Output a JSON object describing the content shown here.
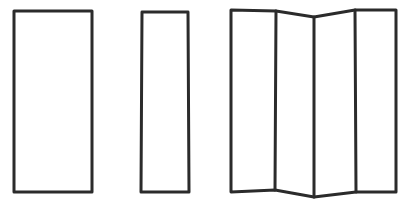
{
  "figure": {
    "background_color": "#ffffff",
    "stroke_color": "#2b2b2b",
    "stroke_width": 3,
    "canvas": {
      "width": 410,
      "height": 202
    }
  },
  "shapes": [
    {
      "id": "wide-rectangle",
      "label": "Wide rectangle",
      "kind": "rectangle",
      "points": "14,11 92,11 92,192 14,192",
      "bounds": {
        "x": 14,
        "y": 11,
        "width": 78,
        "height": 181
      }
    },
    {
      "id": "narrow-rectangle",
      "label": "Narrow rectangle",
      "kind": "rectangle",
      "points": "142,12 188,12 189,192 141,192",
      "bounds": {
        "x": 141,
        "y": 12,
        "width": 48,
        "height": 180
      }
    },
    {
      "id": "folded-screen",
      "label": "Four-panel folded screen",
      "kind": "accordion",
      "outline": "231,10 276,11 314,17 355,10 396,10 396,192 356,192 314,197 275,190 231,192",
      "bounds": {
        "x": 231,
        "y": 10,
        "width": 165,
        "height": 187
      },
      "fold_lines": [
        {
          "id": "fold-1",
          "label": "First fold crease",
          "points": "276,11 275,190"
        },
        {
          "id": "fold-2",
          "label": "Middle fold crease",
          "points": "314,17 314,197"
        },
        {
          "id": "fold-3",
          "label": "Third fold crease",
          "points": "355,10 356,192"
        }
      ]
    }
  ]
}
